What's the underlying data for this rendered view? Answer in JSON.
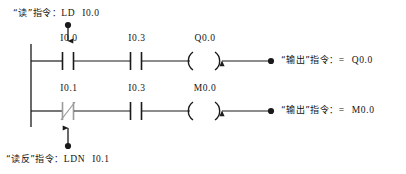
{
  "diagram": {
    "background_color": "#ffffff",
    "line_color": "#1a1a1a"
  },
  "annotations": {
    "top": {
      "quote_open": "“",
      "keyword": "读",
      "quote_close": "”",
      "word": "指令：",
      "mnemonic": "LD",
      "operand": "I0.0",
      "full_text": "“读”指令：LD  I0.0"
    },
    "bottom": {
      "quote_open": "“",
      "keyword": "读反",
      "quote_close": "”",
      "word": "指令：",
      "mnemonic": "LDN",
      "operand": "I0.1",
      "full_text": "“读反”指令：LDN  I0.1"
    },
    "right_1": {
      "quote_open": "“",
      "keyword": "输出",
      "quote_close": "”",
      "word": "指令：",
      "mnemonic": "=",
      "operand": "Q0.0",
      "full_text": "“输出”指令：=  Q0.0"
    },
    "right_2": {
      "quote_open": "“",
      "keyword": "输出",
      "quote_close": "”",
      "word": "指令：",
      "mnemonic": "=",
      "operand": "M0.0",
      "full_text": "“输出”指令：=  M0.0"
    }
  },
  "rungs": [
    {
      "id": "rung-1",
      "contacts": [
        {
          "label": "I0.0",
          "type": "normally-open"
        },
        {
          "label": "I0.3",
          "type": "normally-open"
        }
      ],
      "coil": {
        "label": "Q0.0",
        "type": "output-coil"
      }
    },
    {
      "id": "rung-2",
      "contacts": [
        {
          "label": "I0.1",
          "type": "normally-closed"
        },
        {
          "label": "I0.3",
          "type": "normally-open"
        }
      ],
      "coil": {
        "label": "M0.0",
        "type": "output-coil"
      }
    }
  ],
  "connectors": [
    {
      "id": "connector-ld",
      "from": "annotation-top",
      "to": "contact-i00",
      "direction": "down"
    },
    {
      "id": "connector-ldn",
      "from": "annotation-bottom",
      "to": "contact-i01",
      "direction": "up"
    },
    {
      "id": "connector-out1",
      "from": "annotation-right-1",
      "to": "coil-q00",
      "direction": "left"
    },
    {
      "id": "connector-out2",
      "from": "annotation-right-2",
      "to": "coil-m00",
      "direction": "left"
    }
  ]
}
